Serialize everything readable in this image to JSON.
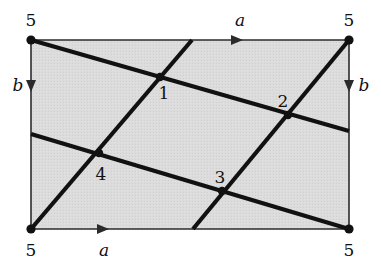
{
  "figure": {
    "type": "torus-identification-diagram",
    "colors": {
      "face_fill": "#d9d9d9",
      "line": "#111111",
      "edge": "#333333",
      "background": "#ffffff"
    },
    "rect": {
      "x": 31,
      "y": 40,
      "width": 318,
      "height": 189
    },
    "corner_labels": [
      {
        "id": "corner-top-left",
        "text": "5",
        "x": 31,
        "y": 26
      },
      {
        "id": "corner-top-right",
        "text": "5",
        "x": 349,
        "y": 26
      },
      {
        "id": "corner-bottom-left",
        "text": "5",
        "x": 31,
        "y": 255
      },
      {
        "id": "corner-bottom-right",
        "text": "5",
        "x": 349,
        "y": 255
      }
    ],
    "edge_labels": [
      {
        "id": "edge-label-a-top",
        "text": "a",
        "x": 240,
        "y": 24,
        "arrow_dir": "right",
        "arrow_x": 238,
        "arrow_y": 40
      },
      {
        "id": "edge-label-a-bottom",
        "text": "a",
        "x": 104,
        "y": 253,
        "arrow_dir": "right",
        "arrow_x": 104,
        "arrow_y": 229
      },
      {
        "id": "edge-label-b-left",
        "text": "b",
        "x": 19,
        "y": 91,
        "arrow_dir": "down",
        "arrow_x": 31,
        "arrow_y": 86
      },
      {
        "id": "edge-label-b-right",
        "text": "b",
        "x": 363,
        "y": 91,
        "arrow_dir": "down",
        "arrow_x": 349,
        "arrow_y": 86
      }
    ],
    "vertices": [
      {
        "id": "vertex-1",
        "label": "1",
        "x": 160,
        "y": 77,
        "label_x": 164,
        "label_y": 98
      },
      {
        "id": "vertex-2",
        "label": "2",
        "x": 288,
        "y": 115,
        "label_x": 283,
        "label_y": 106
      },
      {
        "id": "vertex-3",
        "label": "3",
        "x": 222,
        "y": 191,
        "label_x": 220,
        "label_y": 182
      },
      {
        "id": "vertex-4",
        "label": "4",
        "x": 99,
        "y": 153,
        "label_x": 101,
        "label_y": 179
      }
    ],
    "corner_dots": [
      {
        "id": "corner-dot-top-left",
        "x": 31,
        "y": 40
      },
      {
        "id": "corner-dot-top-right",
        "x": 349,
        "y": 40
      },
      {
        "id": "corner-dot-bottom-left",
        "x": 31,
        "y": 229
      },
      {
        "id": "corner-dot-bottom-right",
        "x": 349,
        "y": 229
      }
    ],
    "cut_lines": [
      {
        "id": "line-a1",
        "family": "shallow",
        "x1": 31,
        "y1": 40,
        "x2": 349,
        "y2": 131,
        "passes": [
          "1",
          "2"
        ]
      },
      {
        "id": "line-a2",
        "family": "shallow",
        "x1": 31,
        "y1": 134,
        "x2": 349,
        "y2": 229,
        "passes": [
          "4",
          "3"
        ]
      },
      {
        "id": "line-b1",
        "family": "steep",
        "x1": 31,
        "y1": 229,
        "x2": 192,
        "y2": 40,
        "passes": [
          "4",
          "1"
        ]
      },
      {
        "id": "line-b2",
        "family": "steep",
        "x1": 193,
        "y1": 229,
        "x2": 349,
        "y2": 40,
        "passes": [
          "3",
          "2"
        ]
      }
    ]
  }
}
